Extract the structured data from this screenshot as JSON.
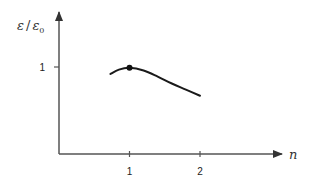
{
  "chart_data": {
    "type": "line",
    "title": "",
    "xlabel": "n",
    "ylabel": "ε / ε₀",
    "ylabel_parts": {
      "num": "ε",
      "sep": "/",
      "den": "ε",
      "den_sub": "0"
    },
    "x_ticks": [
      1,
      2
    ],
    "x_tick_labels": [
      "1",
      "2"
    ],
    "y_ticks": [
      1
    ],
    "y_tick_labels": [
      "1"
    ],
    "xlim": [
      0,
      3.2
    ],
    "ylim": [
      0,
      1.0
    ],
    "grid": false,
    "legend": null,
    "series": [
      {
        "name": "ε/ε₀ vs n",
        "x": [
          0.73,
          0.85,
          1.0,
          1.2,
          1.4,
          1.6,
          1.8,
          2.0
        ],
        "y": [
          0.92,
          0.97,
          0.99,
          0.96,
          0.89,
          0.81,
          0.74,
          0.67
        ]
      }
    ],
    "annotations": [
      {
        "type": "marker",
        "x": 1.0,
        "y": 0.99,
        "description": "filled dot at curve maximum"
      }
    ]
  },
  "colors": {
    "axis": "#555555",
    "curve": "#1a1a1a",
    "background": "#ffffff"
  }
}
